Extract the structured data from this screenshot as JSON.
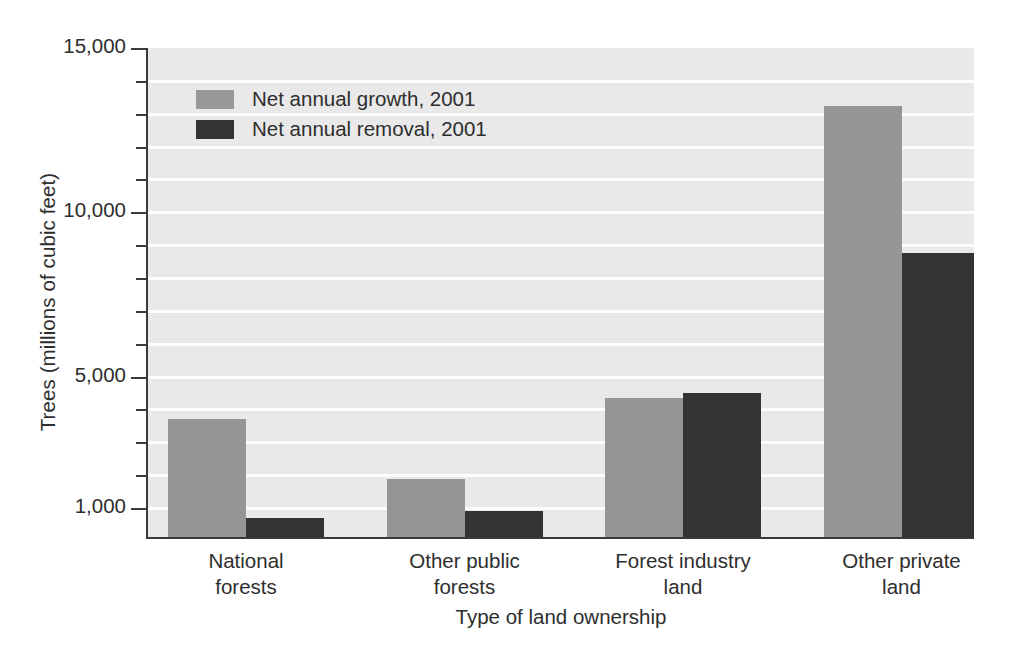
{
  "chart_data": {
    "type": "bar",
    "title": "",
    "xlabel": "Type of land ownership",
    "ylabel": "Trees (millions of cubic feet)",
    "categories": [
      "National forests",
      "Other public forests",
      "Forest industry land",
      "Other private land"
    ],
    "category_lines": [
      [
        "National",
        "forests"
      ],
      [
        "Other public",
        "forests"
      ],
      [
        "Forest industry",
        "land"
      ],
      [
        "Other private",
        "land"
      ]
    ],
    "series": [
      {
        "name": "Net annual growth, 2001",
        "color": "#959595",
        "values": [
          3700,
          1900,
          4350,
          13250
        ]
      },
      {
        "name": "Net annual removal, 2001",
        "color": "#333333",
        "values": [
          700,
          900,
          4500,
          8750
        ]
      }
    ],
    "ylim": [
      120,
      15000
    ],
    "ytick_labels": [
      "15,000",
      "10,000",
      "5,000",
      "1,000"
    ],
    "ytick_values": [
      15000,
      10000,
      5000,
      1000
    ],
    "minor_tick_values": [
      14000,
      13000,
      12000,
      11000,
      9000,
      8000,
      7000,
      6000,
      4000,
      3000,
      2000
    ],
    "grid": true,
    "grid_color": "#fdfdfd",
    "plot_background": "#e9e9e9",
    "legend_position": "top-left",
    "legend": [
      "Net annual growth, 2001",
      "Net annual removal, 2001"
    ]
  }
}
